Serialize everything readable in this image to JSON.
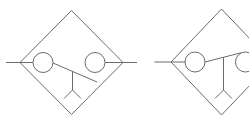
{
  "canvas": {
    "width": 249,
    "height": 123,
    "background": "#ffffff",
    "stroke_color": "#6b6b6b",
    "stroke_width": 1
  },
  "symbols": [
    {
      "name": "separator-symbol-left",
      "icon": "diamond-separator-manual-drain-icon",
      "diamond": [
        [
          20,
          62.5
        ],
        [
          71.5,
          10.5
        ],
        [
          123,
          62.5
        ],
        [
          71.5,
          114.5
        ]
      ],
      "circles": [
        {
          "name": "float-circle-left",
          "cx": 43,
          "cy": 62.5,
          "r": 10
        },
        {
          "name": "float-circle-right",
          "cx": 95,
          "cy": 62.5,
          "r": 10
        }
      ],
      "lines": [
        {
          "name": "inlet-line",
          "x1": 6,
          "y1": 62.5,
          "x2": 33,
          "y2": 62.5
        },
        {
          "name": "outlet-line",
          "x1": 105,
          "y1": 62.5,
          "x2": 137,
          "y2": 62.5
        },
        {
          "name": "lever-line",
          "x1": 53,
          "y1": 63,
          "x2": 97,
          "y2": 82
        },
        {
          "name": "drain-stem",
          "x1": 72.5,
          "y1": 71.5,
          "x2": 72.5,
          "y2": 90
        },
        {
          "name": "drain-prong-left",
          "x1": 72.5,
          "y1": 90,
          "x2": 64,
          "y2": 98.5
        },
        {
          "name": "drain-prong-right",
          "x1": 72.5,
          "y1": 90,
          "x2": 81,
          "y2": 98.5
        }
      ]
    },
    {
      "name": "separator-symbol-right",
      "icon": "diamond-separator-manual-drain-icon",
      "diamond": [
        [
          171,
          62
        ],
        [
          221.5,
          9
        ],
        [
          272,
          62
        ],
        [
          221.5,
          115
        ]
      ],
      "circles": [
        {
          "name": "float-circle-left",
          "cx": 195,
          "cy": 62,
          "r": 10
        },
        {
          "name": "float-circle-right",
          "cx": 245.5,
          "cy": 62,
          "r": 10
        }
      ],
      "lines": [
        {
          "name": "inlet-line",
          "x1": 154.5,
          "y1": 62,
          "x2": 185,
          "y2": 62
        },
        {
          "name": "lever-line",
          "x1": 205,
          "y1": 62,
          "x2": 241,
          "y2": 52.8
        },
        {
          "name": "drain-stem",
          "x1": 223.5,
          "y1": 57.3,
          "x2": 223.5,
          "y2": 90
        },
        {
          "name": "drain-prong-left",
          "x1": 223.5,
          "y1": 90,
          "x2": 215,
          "y2": 98.5
        },
        {
          "name": "drain-prong-right",
          "x1": 223.5,
          "y1": 90,
          "x2": 232,
          "y2": 98.5
        }
      ]
    }
  ]
}
